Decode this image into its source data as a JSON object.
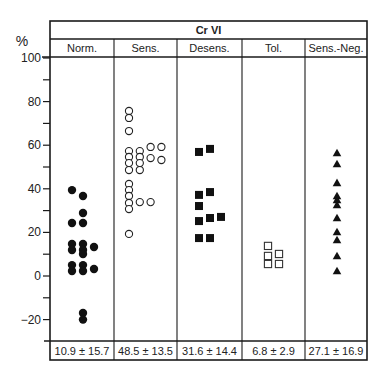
{
  "chart_data": {
    "type": "scatter",
    "title": "Cr VI",
    "ylabel": "%",
    "xlabel": "",
    "ylim": [
      -30,
      100
    ],
    "yticks_labeled": [
      100,
      80,
      60,
      40,
      20,
      0,
      -20
    ],
    "yticks_minor": [
      90,
      70,
      50,
      30,
      10,
      -10
    ],
    "grid": false,
    "legend": null,
    "categories": [
      "Norm.",
      "Sens.",
      "Desens.",
      "Tol.",
      "Sens.-Neg."
    ],
    "series": [
      {
        "name": "Norm.",
        "marker": "filled-circle",
        "points": [
          {
            "offset": 0,
            "y": 39.4
          },
          {
            "offset": 1,
            "y": 36.7
          },
          {
            "offset": 1,
            "y": 28.9
          },
          {
            "offset": 0,
            "y": 24.3
          },
          {
            "offset": 1,
            "y": 24.3
          },
          {
            "offset": 0,
            "y": 14.7
          },
          {
            "offset": 0,
            "y": 11.9
          },
          {
            "offset": 1,
            "y": 14.7
          },
          {
            "offset": 1,
            "y": 11.9
          },
          {
            "offset": 1,
            "y": 10.1
          },
          {
            "offset": 2,
            "y": 13.3
          },
          {
            "offset": 0,
            "y": 5.0
          },
          {
            "offset": 0,
            "y": 2.3
          },
          {
            "offset": 1,
            "y": 5.0
          },
          {
            "offset": 1,
            "y": 2.3
          },
          {
            "offset": 2,
            "y": 3.2
          },
          {
            "offset": 1,
            "y": -17.0
          },
          {
            "offset": 1,
            "y": -20.0
          }
        ],
        "summary": "10.9 ± 15.7"
      },
      {
        "name": "Sens.",
        "marker": "open-circle",
        "points": [
          {
            "offset": 0,
            "y": 75.7
          },
          {
            "offset": 0,
            "y": 72.5
          },
          {
            "offset": 0,
            "y": 66.5
          },
          {
            "offset": 0,
            "y": 57.3
          },
          {
            "offset": 0,
            "y": 54.6
          },
          {
            "offset": 0,
            "y": 51.8
          },
          {
            "offset": 0,
            "y": 48.6
          },
          {
            "offset": 1,
            "y": 57.3
          },
          {
            "offset": 1,
            "y": 54.6
          },
          {
            "offset": 1,
            "y": 51.8
          },
          {
            "offset": 1,
            "y": 48.6
          },
          {
            "offset": 2,
            "y": 59.2
          },
          {
            "offset": 2,
            "y": 54.1
          },
          {
            "offset": 3,
            "y": 59.2
          },
          {
            "offset": 3,
            "y": 53.2
          },
          {
            "offset": 0,
            "y": 42.2
          },
          {
            "offset": 0,
            "y": 39.4
          },
          {
            "offset": 0,
            "y": 36.7
          },
          {
            "offset": 0,
            "y": 33.5
          },
          {
            "offset": 0,
            "y": 30.7
          },
          {
            "offset": 1,
            "y": 33.9
          },
          {
            "offset": 2,
            "y": 33.9
          },
          {
            "offset": 0,
            "y": 19.3
          }
        ],
        "summary": "48.5 ± 13.5"
      },
      {
        "name": "Desens.",
        "marker": "filled-square",
        "points": [
          {
            "offset": 0,
            "y": 56.9
          },
          {
            "offset": 1,
            "y": 58.3
          },
          {
            "offset": 0,
            "y": 37.2
          },
          {
            "offset": 1,
            "y": 38.5
          },
          {
            "offset": 0,
            "y": 32.1
          },
          {
            "offset": 0,
            "y": 25.2
          },
          {
            "offset": 1,
            "y": 26.6
          },
          {
            "offset": 2,
            "y": 27.1
          },
          {
            "offset": 0,
            "y": 17.4
          },
          {
            "offset": 1,
            "y": 17.4
          }
        ],
        "summary": "31.6 ± 14.4"
      },
      {
        "name": "Tol.",
        "marker": "open-square",
        "points": [
          {
            "offset": 0,
            "y": 13.8
          },
          {
            "offset": 0,
            "y": 9.2
          },
          {
            "offset": 1,
            "y": 10.1
          },
          {
            "offset": 0,
            "y": 5.5
          },
          {
            "offset": 1,
            "y": 5.5
          }
        ],
        "summary": "6.8 ± 2.9"
      },
      {
        "name": "Sens.-Neg.",
        "marker": "filled-triangle",
        "points": [
          {
            "offset": 0,
            "y": 56.4
          },
          {
            "offset": 0,
            "y": 51.4
          },
          {
            "offset": 0,
            "y": 42.7
          },
          {
            "offset": 0,
            "y": 36.7
          },
          {
            "offset": 0,
            "y": 34.9
          },
          {
            "offset": 0,
            "y": 32.6
          },
          {
            "offset": 0,
            "y": 26.6
          },
          {
            "offset": 0,
            "y": 20.2
          },
          {
            "offset": 0,
            "y": 16.5
          },
          {
            "offset": 0,
            "y": 9.2
          },
          {
            "offset": 0,
            "y": 2.3
          }
        ],
        "summary": "27.1 ± 16.9"
      }
    ]
  },
  "header": {
    "title": "Cr VI",
    "y_unit": "%"
  },
  "summary_row": [
    "10.9 ± 15.7",
    "48.5 ± 13.5",
    "31.6 ± 14.4",
    "6.8 ± 2.9",
    "27.1 ± 16.9"
  ]
}
